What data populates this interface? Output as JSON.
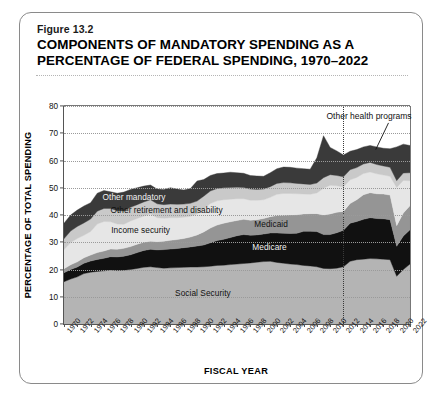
{
  "figure": {
    "number": "Figure 13.2",
    "title": "COMPONENTS OF MANDATORY SPENDING AS A PERCENTAGE OF FEDERAL SPENDING, 1970–2022"
  },
  "axes": {
    "y_title": "PERCENTAGE OF TOTAL SPENDING",
    "x_title": "FISCAL YEAR",
    "y_ticks": [
      "0",
      "10",
      "20",
      "30",
      "40",
      "50",
      "60",
      "70",
      "80"
    ],
    "x_ticks": [
      "1970",
      "1972",
      "1974",
      "1976",
      "1978",
      "1980",
      "1982",
      "1984",
      "1986",
      "1988",
      "1990",
      "1992",
      "1994",
      "1996",
      "1998",
      "2000",
      "2002",
      "2004",
      "2006",
      "2008",
      "2010",
      "2012",
      "2014",
      "2016",
      "2018",
      "2020",
      "2022"
    ]
  },
  "annotations": {
    "callout": "Other health programs",
    "divider_year": 2012
  },
  "colors": {
    "social_security": "#b4b4b4",
    "medicare": "#111111",
    "medicaid": "#959595",
    "income_security": "#e6e6e6",
    "other_retirement": "#c9c9c9",
    "other_health": "#3a3a3a",
    "plot_background": "#ffffff",
    "border": "#8a8a8a"
  },
  "chart_data": {
    "type": "area",
    "title": "COMPONENTS OF MANDATORY SPENDING AS A PERCENTAGE OF FEDERAL SPENDING, 1970–2022",
    "xlabel": "FISCAL YEAR",
    "ylabel": "PERCENTAGE OF TOTAL SPENDING",
    "ylim": [
      0,
      80
    ],
    "xlim": [
      1970,
      2022
    ],
    "grid": true,
    "stacked": true,
    "legend_position": "inline-labels",
    "x": [
      1970,
      1971,
      1972,
      1973,
      1974,
      1975,
      1976,
      1977,
      1978,
      1979,
      1980,
      1981,
      1982,
      1983,
      1984,
      1985,
      1986,
      1987,
      1988,
      1989,
      1990,
      1991,
      1992,
      1993,
      1994,
      1995,
      1996,
      1997,
      1998,
      1999,
      2000,
      2001,
      2002,
      2003,
      2004,
      2005,
      2006,
      2007,
      2008,
      2009,
      2010,
      2011,
      2012,
      2013,
      2014,
      2015,
      2016,
      2017,
      2018,
      2019,
      2020,
      2021,
      2022
    ],
    "series": [
      {
        "name": "Social Security",
        "label": "Social Security",
        "color": "#b4b4b4",
        "values": [
          15.5,
          16.5,
          17.3,
          18.5,
          19.0,
          19.3,
          19.5,
          19.8,
          19.6,
          19.7,
          20.0,
          20.4,
          20.8,
          21.0,
          20.7,
          20.5,
          20.6,
          20.7,
          20.8,
          20.9,
          20.9,
          21.0,
          21.2,
          21.5,
          21.6,
          21.8,
          22.0,
          22.2,
          22.4,
          22.7,
          22.9,
          23.0,
          22.6,
          22.3,
          22.0,
          21.8,
          21.5,
          21.3,
          21.0,
          20.4,
          20.3,
          20.5,
          21.0,
          23.0,
          23.6,
          23.8,
          24.0,
          23.9,
          23.8,
          23.6,
          17.5,
          20.0,
          22.0
        ]
      },
      {
        "name": "Medicare",
        "label": "Medicare",
        "color": "#111111",
        "values": [
          3.3,
          3.5,
          3.6,
          3.8,
          4.1,
          4.4,
          4.6,
          4.9,
          5.0,
          5.2,
          5.4,
          5.8,
          6.2,
          6.4,
          6.5,
          6.8,
          6.9,
          7.0,
          7.2,
          7.4,
          7.7,
          8.0,
          8.6,
          9.1,
          9.5,
          9.9,
          10.4,
          10.6,
          10.2,
          10.0,
          10.1,
          10.4,
          10.8,
          11.0,
          11.2,
          11.5,
          12.5,
          12.7,
          12.9,
          12.4,
          12.5,
          13.0,
          13.4,
          14.0,
          14.0,
          14.6,
          15.0,
          14.8,
          14.8,
          14.7,
          11.0,
          12.3,
          12.6
        ]
      },
      {
        "name": "Medicaid",
        "label": "Medicaid",
        "color": "#959595",
        "values": [
          1.5,
          1.7,
          1.9,
          2.0,
          2.2,
          2.5,
          2.7,
          2.8,
          2.8,
          2.9,
          3.0,
          3.1,
          3.0,
          3.0,
          3.0,
          3.1,
          3.2,
          3.3,
          3.4,
          3.6,
          4.1,
          4.8,
          5.4,
          5.7,
          5.9,
          5.8,
          5.6,
          5.6,
          5.5,
          5.6,
          5.7,
          6.0,
          6.4,
          6.6,
          6.8,
          6.8,
          6.4,
          6.5,
          6.6,
          7.2,
          7.6,
          7.5,
          6.9,
          7.2,
          8.0,
          9.0,
          9.2,
          9.1,
          9.1,
          9.0,
          7.6,
          8.4,
          8.8
        ]
      },
      {
        "name": "Income security",
        "label": "Income security",
        "color": "#e6e6e6",
        "values": [
          7.0,
          8.2,
          8.6,
          8.3,
          8.6,
          10.5,
          10.8,
          10.0,
          9.3,
          8.8,
          9.4,
          9.4,
          9.6,
          10.0,
          8.8,
          8.4,
          8.3,
          8.0,
          7.8,
          7.6,
          7.7,
          8.4,
          9.0,
          8.9,
          8.6,
          8.3,
          8.0,
          7.6,
          7.3,
          7.1,
          6.9,
          7.1,
          7.8,
          8.0,
          7.9,
          7.7,
          7.3,
          7.1,
          7.6,
          9.8,
          10.5,
          9.7,
          9.0,
          8.7,
          8.2,
          7.8,
          7.6,
          7.3,
          7.0,
          6.9,
          14.0,
          12.0,
          9.2
        ]
      },
      {
        "name": "Other retirement and disability",
        "label": "Other retirement and disability",
        "color": "#c9c9c9",
        "values": [
          4.0,
          4.2,
          4.4,
          4.5,
          4.6,
          4.7,
          4.8,
          4.9,
          4.9,
          4.9,
          5.0,
          5.1,
          5.2,
          5.2,
          5.1,
          5.0,
          5.0,
          4.9,
          4.8,
          4.8,
          4.7,
          4.7,
          4.6,
          4.5,
          4.4,
          4.3,
          4.2,
          4.1,
          4.1,
          4.0,
          3.9,
          3.9,
          4.0,
          4.0,
          3.9,
          3.8,
          3.7,
          3.6,
          3.6,
          3.9,
          3.9,
          3.8,
          3.7,
          3.7,
          3.6,
          3.5,
          3.5,
          3.4,
          3.3,
          3.3,
          2.5,
          2.7,
          2.9
        ]
      },
      {
        "name": "Other mandatory and other health programs",
        "label": "Other mandatory",
        "color": "#3a3a3a",
        "values": [
          5.7,
          5.9,
          6.0,
          6.2,
          6.0,
          6.6,
          6.6,
          6.1,
          6.4,
          6.9,
          6.6,
          6.2,
          5.8,
          5.4,
          5.4,
          5.6,
          6.0,
          5.6,
          5.2,
          5.4,
          7.4,
          6.1,
          5.7,
          5.5,
          5.4,
          5.6,
          5.3,
          5.2,
          5.0,
          4.9,
          4.7,
          5.1,
          5.4,
          5.7,
          5.7,
          5.6,
          5.6,
          5.6,
          9.3,
          15.4,
          10.0,
          9.0,
          8.0,
          6.8,
          6.6,
          6.3,
          6.2,
          6.5,
          6.5,
          6.8,
          12.4,
          10.6,
          10.0
        ]
      }
    ],
    "totals_note": "Stacked totals rise from about 37% in 1970 to about 66% in 2022, peaking near 69% in 2009."
  }
}
